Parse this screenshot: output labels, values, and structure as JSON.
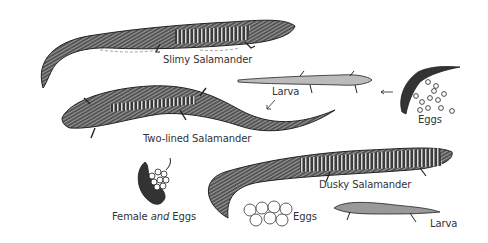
{
  "illustration": {
    "labels": {
      "slimy": "Slimy Salamander",
      "larva_top": "Larva",
      "eggs_top": "Eggs",
      "two_lined": "Two-lined Salamander",
      "dusky": "Dusky Salamander",
      "female_a": "Female ",
      "female_b": "and",
      "female_c": " Eggs",
      "eggs_bottom": "Eggs",
      "larva_bottom": "Larva"
    },
    "colors": {
      "ink": "#222222",
      "background": "#ffffff"
    }
  }
}
